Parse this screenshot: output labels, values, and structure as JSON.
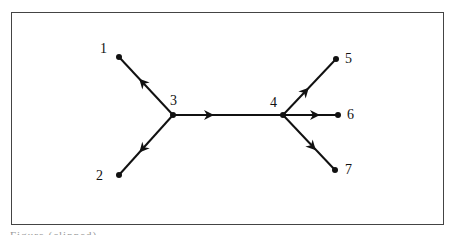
{
  "diagram": {
    "nodes": [
      {
        "id": "1",
        "label": "1",
        "x": 119,
        "y": 57
      },
      {
        "id": "2",
        "label": "2",
        "x": 119,
        "y": 175
      },
      {
        "id": "3",
        "label": "3",
        "x": 173,
        "y": 115
      },
      {
        "id": "4",
        "label": "4",
        "x": 283,
        "y": 115
      },
      {
        "id": "5",
        "label": "5",
        "x": 336,
        "y": 59
      },
      {
        "id": "6",
        "label": "6",
        "x": 338,
        "y": 115
      },
      {
        "id": "7",
        "label": "7",
        "x": 335,
        "y": 170
      }
    ],
    "edges": [
      {
        "from": "3",
        "to": "1",
        "arrow": "toward-1"
      },
      {
        "from": "3",
        "to": "2",
        "arrow": "toward-2"
      },
      {
        "from": "3",
        "to": "4",
        "arrow": "toward-4"
      },
      {
        "from": "4",
        "to": "5",
        "arrow": "toward-5"
      },
      {
        "from": "4",
        "to": "6",
        "arrow": "toward-6"
      },
      {
        "from": "4",
        "to": "7",
        "arrow": "toward-7"
      }
    ],
    "colors": {
      "line": "#111111",
      "frame": "#444444"
    }
  },
  "caption": {
    "text": "Figure (clipped)"
  }
}
